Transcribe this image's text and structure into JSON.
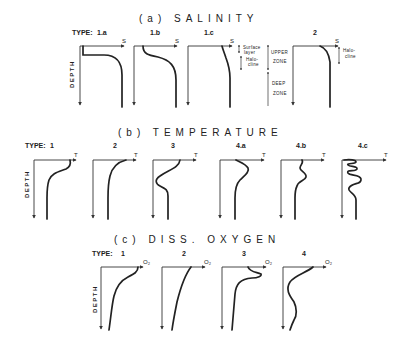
{
  "sections": [
    {
      "id": "salinity",
      "title": "(a)   SALINITY",
      "type_prefix": "TYPE:",
      "axis_symbol": "S",
      "depth_label": "DEPTH",
      "panels": [
        {
          "label": "1.a"
        },
        {
          "label": "1.b"
        },
        {
          "label": "1.c"
        },
        {
          "label": "2"
        }
      ],
      "annotations": {
        "surface_layer": "Surface layer",
        "halocline": "Halo- cline",
        "upper_zone": "UPPER ZONE",
        "deep_zone": "DEEP ZONE",
        "halocline_type2": "Halo- cline"
      }
    },
    {
      "id": "temperature",
      "title": "(b)   TEMPERATURE",
      "type_prefix": "TYPE:",
      "axis_symbol": "T",
      "depth_label": "DEPTH",
      "panels": [
        {
          "label": "1"
        },
        {
          "label": "2"
        },
        {
          "label": "3"
        },
        {
          "label": "4.a"
        },
        {
          "label": "4.b"
        },
        {
          "label": "4.c"
        }
      ]
    },
    {
      "id": "oxygen",
      "title": "(c)   DISS. OXYGEN",
      "type_prefix": "TYPE:",
      "axis_symbol": "O₂",
      "depth_label": "DEPTH",
      "panels": [
        {
          "label": "1"
        },
        {
          "label": "2"
        },
        {
          "label": "3"
        },
        {
          "label": "4"
        }
      ]
    }
  ]
}
